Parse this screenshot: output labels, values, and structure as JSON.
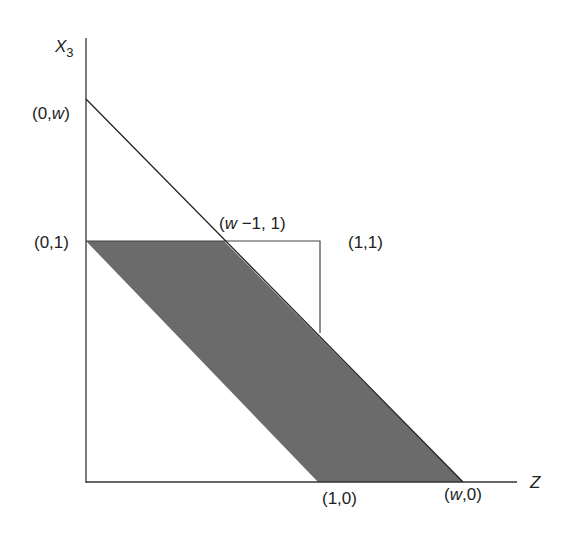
{
  "diagram": {
    "axes": {
      "y_label": "X",
      "y_label_sub": "3",
      "x_label": "Z"
    },
    "points": {
      "y_w": {
        "label_pre": "(0,",
        "label_var": "w",
        "label_post": ")"
      },
      "y_1": {
        "label": "(0,1)"
      },
      "top_intersect": {
        "label_pre": "(",
        "label_var": "w",
        "label_post": " −1, 1)"
      },
      "corner_11": {
        "label": "(1,1)"
      },
      "x_1": {
        "label": "(1,0)"
      },
      "x_w": {
        "label_pre": "(",
        "label_var": "w",
        "label_post": ",0)"
      }
    },
    "colors": {
      "shade": "#6b6b6b",
      "line": "#333333"
    }
  }
}
